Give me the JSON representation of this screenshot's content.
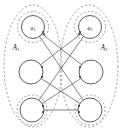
{
  "figure": {
    "width": 123,
    "height": 129,
    "background_color": "#ffffff",
    "node_stroke_color": "#4a4a4a",
    "edge_color": "#4f4f4f",
    "boundary_color": "#8a8a8a",
    "label_color": "#1a1a1a"
  },
  "groups": [
    {
      "id": "A1",
      "label_base": "A",
      "label_sub": "1",
      "label_x": 16,
      "label_y": 47,
      "ellipse": {
        "cx": 33,
        "cy": 66,
        "rx": 29,
        "ry": 61
      },
      "side": "left"
    },
    {
      "id": "A2",
      "label_base": "A",
      "label_sub": "2",
      "label_x": 104,
      "label_y": 47,
      "ellipse": {
        "cx": 89,
        "cy": 66,
        "rx": 29,
        "ry": 61
      },
      "side": "right"
    }
  ],
  "nodes": [
    {
      "id": "L1",
      "group": "A1",
      "cx": 33,
      "cy": 27,
      "r": 11.5,
      "label_base": "a",
      "label_sub": "1",
      "halo": true,
      "halo_r": 15.5
    },
    {
      "id": "L2",
      "group": "A1",
      "cx": 31,
      "cy": 72,
      "r": 12.0,
      "label_base": "",
      "label_sub": "",
      "halo": false,
      "halo_r": 0
    },
    {
      "id": "L3",
      "group": "A1",
      "cx": 32,
      "cy": 110,
      "r": 12.0,
      "label_base": "",
      "label_sub": "",
      "halo": true,
      "halo_r": 15.0
    },
    {
      "id": "R1",
      "group": "A2",
      "cx": 90,
      "cy": 27,
      "r": 11.5,
      "label_base": "a",
      "label_sub": "2",
      "halo": true,
      "halo_r": 15.5
    },
    {
      "id": "R2",
      "group": "A2",
      "cx": 91,
      "cy": 72,
      "r": 12.0,
      "label_base": "",
      "label_sub": "",
      "halo": false,
      "halo_r": 0
    },
    {
      "id": "R3",
      "group": "A2",
      "cx": 90,
      "cy": 110,
      "r": 12.0,
      "label_base": "",
      "label_sub": "",
      "halo": true,
      "halo_r": 15.0
    }
  ],
  "edges": [
    {
      "from": "L1",
      "to": "R2"
    },
    {
      "from": "L1",
      "to": "R3"
    },
    {
      "from": "L2",
      "to": "R1"
    },
    {
      "from": "L2",
      "to": "R3"
    },
    {
      "from": "L3",
      "to": "R1"
    },
    {
      "from": "L3",
      "to": "R2"
    },
    {
      "from": "L3",
      "to": "R3"
    }
  ],
  "edge_endpoint_dots": [
    {
      "x": 43,
      "y": 32
    },
    {
      "x": 44,
      "y": 34
    },
    {
      "x": 80,
      "y": 32
    },
    {
      "x": 79,
      "y": 34
    },
    {
      "x": 42,
      "y": 67
    },
    {
      "x": 42,
      "y": 77
    },
    {
      "x": 80,
      "y": 67
    },
    {
      "x": 80,
      "y": 77
    },
    {
      "x": 43,
      "y": 106
    },
    {
      "x": 43,
      "y": 112
    },
    {
      "x": 79,
      "y": 106
    },
    {
      "x": 79,
      "y": 112
    }
  ]
}
